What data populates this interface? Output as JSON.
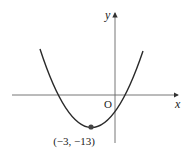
{
  "diagram": {
    "type": "parabola-graph",
    "axis_labels": {
      "x": "x",
      "y": "y",
      "origin": "O"
    },
    "vertex": {
      "x": -3,
      "y": -13,
      "label": "(−3, −13)"
    },
    "colors": {
      "curve": "#2a2a2a",
      "axis": "#555555",
      "point": "#444444"
    }
  }
}
